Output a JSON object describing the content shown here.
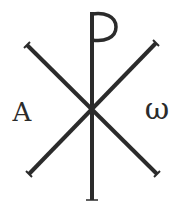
{
  "symbol": {
    "name": "Chi-Rho with Alpha and Omega",
    "ink_color": "#2b2b2b",
    "background_color": "#ffffff"
  },
  "letters": {
    "alpha": "A",
    "omega": "ω"
  }
}
